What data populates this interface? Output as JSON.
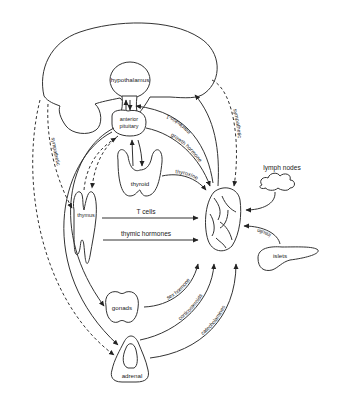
{
  "organs": {
    "hypothalamus": "hypothalamus",
    "anterior_pituitary_line1": "anterior",
    "anterior_pituitary_line2": "pituitary",
    "thyroid": "thyroid",
    "thymus": "thymus",
    "gonads": "gonads",
    "adrenal": "adrenal",
    "lymph_nodes": "lymph nodes",
    "islets": "islets"
  },
  "pathways": {
    "interleukin": "interleukin-1",
    "growth_hormone": "growth hormone",
    "sympathetic_right": "sympathetic",
    "sympathetic_left": "sympathetic",
    "thyroxine": "thyroxine",
    "t_cells": "T cells",
    "thymic_hormones": "thymic hormones",
    "insulin": "insulin",
    "sex_hormone": "sex hormone",
    "corticosteroids": "corticosteroids",
    "catecholamines": "catecholamines"
  },
  "colors": {
    "stroke": "#333333",
    "background": "#ffffff"
  }
}
